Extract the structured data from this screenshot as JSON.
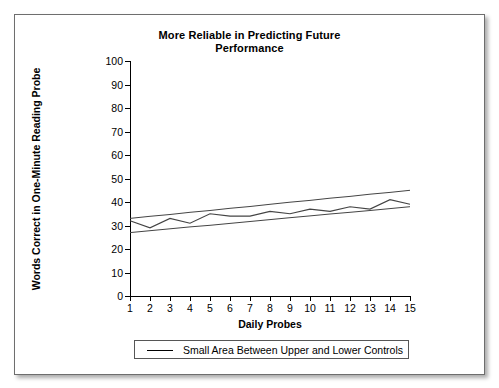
{
  "chart_data": {
    "type": "line",
    "title": "More Reliable in Predicting Future Performance",
    "title_lines": [
      "More Reliable in Predicting Future",
      "Performance"
    ],
    "xlabel": "Daily Probes",
    "ylabel": "Words Correct in One-Minute Reading Probe",
    "x": [
      1,
      2,
      3,
      4,
      5,
      6,
      7,
      8,
      9,
      10,
      11,
      12,
      13,
      14,
      15
    ],
    "xtick_labels": [
      "1",
      "2",
      "3",
      "4",
      "5",
      "6",
      "7",
      "8",
      "9",
      "10",
      "11",
      "12",
      "13",
      "14",
      "15"
    ],
    "ytick_labels": [
      "0",
      "10",
      "20",
      "30",
      "40",
      "50",
      "60",
      "70",
      "80",
      "90",
      "100"
    ],
    "yticks": [
      0,
      10,
      20,
      30,
      40,
      50,
      60,
      70,
      80,
      90,
      100
    ],
    "ylim": [
      0,
      100
    ],
    "xlim": [
      1,
      15
    ],
    "grid": false,
    "legend_position": "below-plot",
    "series": [
      {
        "name": "Student Performance",
        "style": "zigzag-line",
        "color": "#444444",
        "values": [
          32,
          29,
          33,
          31,
          35,
          34,
          34,
          36,
          35,
          37,
          36,
          38,
          37,
          41,
          39
        ]
      },
      {
        "name": "Upper Control Line",
        "style": "straight-line",
        "color": "#444444",
        "values": [
          33,
          33.9,
          34.7,
          35.6,
          36.4,
          37.3,
          38.1,
          39,
          39.9,
          40.7,
          41.6,
          42.4,
          43.3,
          44.1,
          45
        ]
      },
      {
        "name": "Lower Control Line",
        "style": "straight-line",
        "color": "#444444",
        "values": [
          27,
          27.8,
          28.6,
          29.4,
          30.1,
          30.9,
          31.7,
          32.5,
          33.3,
          34.1,
          34.9,
          35.6,
          36.4,
          37.2,
          38
        ]
      }
    ],
    "legend": [
      {
        "label": "Small Area Between Upper and Lower Controls",
        "marker": "line",
        "color": "#000000"
      }
    ]
  }
}
